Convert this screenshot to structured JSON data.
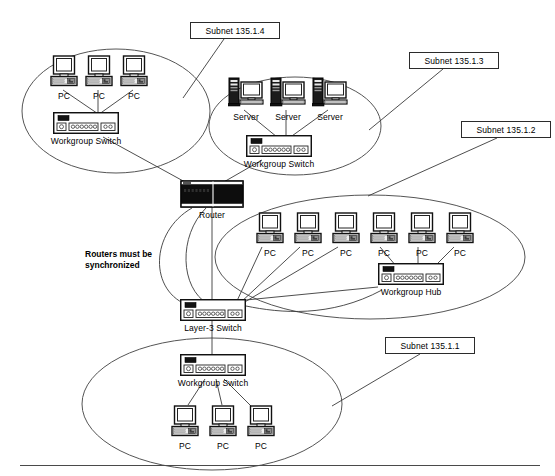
{
  "diagram": {
    "background_color": "#ffffff",
    "line_color": "#3a3a3a",
    "text_color": "#000000",
    "note": "Routers must be\nsynchronized",
    "subnet_labels": [
      {
        "id": "subnet-135-1-4",
        "text": "Subnet 135.1.4",
        "x": 190,
        "y": 22,
        "w": 90,
        "h": 17
      },
      {
        "id": "subnet-135-1-3",
        "text": "Subnet 135.1.3",
        "x": 409,
        "y": 52,
        "w": 90,
        "h": 17
      },
      {
        "id": "subnet-135-1-2",
        "text": "Subnet 135.1.2",
        "x": 461,
        "y": 121,
        "w": 90,
        "h": 17
      },
      {
        "id": "subnet-135-1-1",
        "text": "Subnet 135.1.1",
        "x": 385,
        "y": 337,
        "w": 90,
        "h": 17
      }
    ],
    "clouds": [
      {
        "id": "cloud-subnet-135-1-4",
        "cx": 116,
        "cy": 111,
        "rx": 94,
        "ry": 62
      },
      {
        "id": "cloud-subnet-135-1-3",
        "cx": 295,
        "cy": 126,
        "rx": 86,
        "ry": 49
      },
      {
        "id": "cloud-subnet-135-1-2",
        "cx": 370,
        "cy": 257,
        "rx": 155,
        "ry": 62
      },
      {
        "id": "cloud-subnet-135-1-1",
        "cx": 212,
        "cy": 404,
        "rx": 130,
        "ry": 66
      }
    ],
    "devices": [
      {
        "id": "pc-a1",
        "type": "pc",
        "label": "PC",
        "x": 50,
        "y": 55
      },
      {
        "id": "pc-a2",
        "type": "pc",
        "label": "PC",
        "x": 85,
        "y": 55
      },
      {
        "id": "pc-a3",
        "type": "pc",
        "label": "PC",
        "x": 120,
        "y": 55
      },
      {
        "id": "sw-a",
        "type": "switch",
        "label": "Workgroup Switch",
        "x": 53,
        "y": 112
      },
      {
        "id": "srv-b1",
        "type": "server",
        "label": "Server",
        "x": 228,
        "y": 76
      },
      {
        "id": "srv-b2",
        "type": "server",
        "label": "Server",
        "x": 270,
        "y": 76
      },
      {
        "id": "srv-b3",
        "type": "server",
        "label": "Server",
        "x": 312,
        "y": 76
      },
      {
        "id": "sw-b",
        "type": "switch",
        "label": "Workgroup Switch",
        "x": 246,
        "y": 135
      },
      {
        "id": "router",
        "type": "router",
        "label": "Router",
        "x": 180,
        "y": 180
      },
      {
        "id": "pc-c1",
        "type": "pc",
        "label": "PC",
        "x": 256,
        "y": 212
      },
      {
        "id": "pc-c2",
        "type": "pc",
        "label": "PC",
        "x": 294,
        "y": 212
      },
      {
        "id": "pc-c3",
        "type": "pc",
        "label": "PC",
        "x": 332,
        "y": 212
      },
      {
        "id": "pc-c4",
        "type": "pc",
        "label": "PC",
        "x": 370,
        "y": 212
      },
      {
        "id": "pc-c5",
        "type": "pc",
        "label": "PC",
        "x": 408,
        "y": 212
      },
      {
        "id": "pc-c6",
        "type": "pc",
        "label": "PC",
        "x": 446,
        "y": 212
      },
      {
        "id": "hub-c",
        "type": "hub",
        "label": "Workgroup Hub",
        "x": 378,
        "y": 263
      },
      {
        "id": "l3sw",
        "type": "switch",
        "label": "Layer-3 Switch",
        "x": 180,
        "y": 299
      },
      {
        "id": "sw-d",
        "type": "switch",
        "label": "Workgroup Switch",
        "x": 180,
        "y": 354
      },
      {
        "id": "pc-d1",
        "type": "pc",
        "label": "PC",
        "x": 171,
        "y": 405
      },
      {
        "id": "pc-d2",
        "type": "pc",
        "label": "PC",
        "x": 209,
        "y": 405
      },
      {
        "id": "pc-d3",
        "type": "pc",
        "label": "PC",
        "x": 247,
        "y": 405
      }
    ],
    "links": [
      {
        "from": "pc-a1",
        "to": "sw-a",
        "d": "M 63,90 L 110,122"
      },
      {
        "from": "pc-a2",
        "to": "sw-a",
        "d": "M 98,90 L 98,122"
      },
      {
        "from": "pc-a3",
        "to": "sw-a",
        "d": "M 133,90 L 88,122"
      },
      {
        "from": "sw-a",
        "to": "router",
        "d": "M 103,137 L 196,188"
      },
      {
        "from": "srv-b1",
        "to": "sw-b",
        "d": "M 244,110 L 288,146"
      },
      {
        "from": "srv-b2",
        "to": "sw-b",
        "d": "M 286,110 L 286,146"
      },
      {
        "from": "srv-b3",
        "to": "sw-b",
        "d": "M 328,110 L 278,146"
      },
      {
        "from": "sw-b",
        "to": "router",
        "d": "M 262,160 L 222,183"
      },
      {
        "from": "router",
        "to": "l3sw",
        "d": "M 212,206 L 212,303"
      },
      {
        "from": "pc-c1",
        "to": "l3sw",
        "d": "M 262,247 L 236,303"
      },
      {
        "from": "pc-c2",
        "to": "l3sw",
        "d": "M 300,247 L 240,303"
      },
      {
        "from": "pc-c3",
        "to": "l3sw",
        "d": "M 338,247 L 243,303"
      },
      {
        "from": "pc-c4",
        "to": "hub-c",
        "d": "M 380,247 L 402,273"
      },
      {
        "from": "pc-c5",
        "to": "hub-c",
        "d": "M 418,247 L 418,273"
      },
      {
        "from": "pc-c6",
        "to": "hub-c",
        "d": "M 454,247 L 428,273"
      },
      {
        "from": "hub-c",
        "to": "l3sw",
        "d": "M 378,287 L 246,300"
      },
      {
        "from": "hub-c",
        "to": "l3sw",
        "d": "M 382,290 C 330,318 280,313 246,306"
      },
      {
        "from": "l3sw",
        "to": "sw-d",
        "d": "M 212,320 L 212,358"
      },
      {
        "from": "sw-d",
        "to": "pc-d1",
        "d": "M 205,379 L 188,405"
      },
      {
        "from": "sw-d",
        "to": "pc-d2",
        "d": "M 216,379 L 222,405"
      },
      {
        "from": "sw-d",
        "to": "pc-d3",
        "d": "M 224,379 L 252,407"
      },
      {
        "from": "subnet-135-1-4",
        "to": "cloud-subnet-135-1-4",
        "d": "M 224,39 L 183,98"
      },
      {
        "from": "subnet-135-1-3",
        "to": "cloud-subnet-135-1-3",
        "d": "M 443,69 L 369,130"
      },
      {
        "from": "subnet-135-1-2",
        "to": "cloud-subnet-135-1-2",
        "d": "M 497,138 L 368,196"
      },
      {
        "from": "subnet-135-1-1",
        "to": "cloud-subnet-135-1-1",
        "d": "M 420,354 L 332,406"
      },
      {
        "from": "router",
        "to": "ring-left",
        "d": "M 192,208 C 150,232 148,292 190,306"
      },
      {
        "from": "router",
        "to": "ring-inner",
        "d": "M 206,208 C 178,236 180,288 208,304"
      }
    ],
    "footer_rule": {
      "x": 20,
      "y": 465,
      "w": 520
    }
  }
}
